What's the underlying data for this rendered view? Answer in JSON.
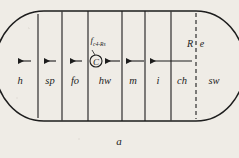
{
  "figure": {
    "caption": "a",
    "outline_shape": "stadium",
    "stroke_color": "#1d1d1d",
    "background_color": "#efece6",
    "compartments": [
      {
        "label": "h",
        "cx": 20,
        "cy": 81
      },
      {
        "label": "sp",
        "cx": 50,
        "cy": 81
      },
      {
        "label": "fo",
        "cx": 75,
        "cy": 81
      },
      {
        "label": "hw",
        "cx": 105,
        "cy": 81
      },
      {
        "label": "m",
        "cx": 133,
        "cy": 81
      },
      {
        "label": "i",
        "cx": 158,
        "cy": 81
      },
      {
        "label": "ch",
        "cx": 182,
        "cy": 81
      },
      {
        "label": "sw",
        "cx": 214,
        "cy": 81
      }
    ],
    "dividers_x": [
      38,
      62,
      88,
      122,
      145,
      171,
      196
    ],
    "dashed_divider_x": 196,
    "node": {
      "symbol": "C",
      "cx": 96,
      "cy": 61,
      "r": 6
    },
    "flux_label": {
      "main": "f",
      "sub": "c",
      "sub2": "4",
      "tail": "-Rs",
      "cx": 98,
      "cy": 42
    },
    "re_label": {
      "left": "R",
      "right": "e",
      "cx": 196,
      "cy": 44
    },
    "arrows": [
      {
        "x1": 31,
        "x2": 16,
        "y": 61,
        "style": "short"
      },
      {
        "x1": 56,
        "x2": 42,
        "y": 61,
        "style": "short"
      },
      {
        "x1": 82,
        "x2": 68,
        "y": 61,
        "style": "short"
      },
      {
        "x1": 120,
        "x2": 104,
        "y": 61,
        "style": "short"
      },
      {
        "x1": 144,
        "x2": 124,
        "y": 61,
        "style": "long"
      },
      {
        "x1": 192,
        "x2": 148,
        "y": 61,
        "style": "long"
      }
    ]
  }
}
